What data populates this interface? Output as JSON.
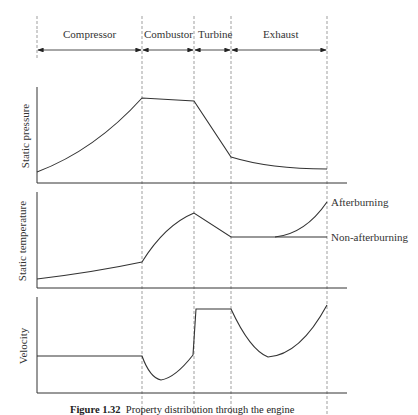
{
  "sections": [
    {
      "label": "Compressor",
      "x0": 37,
      "x1": 142
    },
    {
      "label": "Combustor",
      "x0": 142,
      "x1": 194
    },
    {
      "label": "Turbine",
      "x0": 194,
      "x1": 231
    },
    {
      "label": "Exhaust",
      "x0": 231,
      "x1": 327
    }
  ],
  "panels": [
    {
      "ylabel": "Static pressure"
    },
    {
      "ylabel": "Static temperature",
      "annotations": [
        "Afterburning",
        "Non-afterburning"
      ]
    },
    {
      "ylabel": "Velocity"
    }
  ],
  "caption": {
    "number": "Figure 1.32",
    "text": "Property distribution through the engine"
  }
}
